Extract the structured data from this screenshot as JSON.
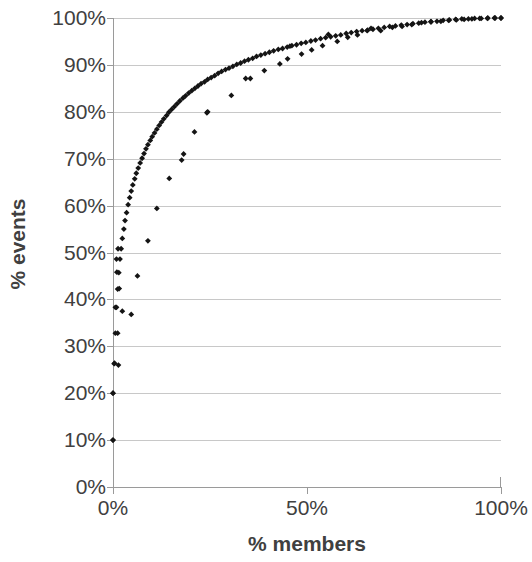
{
  "chart_data": {
    "type": "scatter",
    "title": "",
    "xlabel": "% members",
    "ylabel": "% events",
    "xlim": [
      0,
      100
    ],
    "ylim": [
      0,
      100
    ],
    "xticks": [
      "0%",
      "50%",
      "100%"
    ],
    "xtick_values": [
      0,
      50,
      100
    ],
    "yticks": [
      "0%",
      "10%",
      "20%",
      "30%",
      "40%",
      "50%",
      "60%",
      "70%",
      "80%",
      "90%",
      "100%"
    ],
    "ytick_values": [
      0,
      10,
      20,
      30,
      40,
      50,
      60,
      70,
      80,
      90,
      100
    ],
    "grid": true,
    "legend": "none",
    "marker_color": "#141414",
    "gridline_color": "#c8c8c8",
    "axis_color": "#9a9a9a",
    "label_color": "#404040",
    "series": [
      {
        "name": "dense-series",
        "marker": "diamond",
        "points": [
          [
            0.0,
            10.0
          ],
          [
            0.0,
            20.0
          ],
          [
            0.3,
            26.3
          ],
          [
            0.6,
            32.8
          ],
          [
            0.9,
            38.3
          ],
          [
            1.2,
            42.2
          ],
          [
            1.5,
            45.7
          ],
          [
            1.8,
            48.6
          ],
          [
            2.1,
            50.8
          ],
          [
            2.4,
            53.0
          ],
          [
            2.8,
            55.0
          ],
          [
            3.1,
            56.8
          ],
          [
            3.5,
            58.5
          ],
          [
            3.9,
            60.2
          ],
          [
            4.3,
            61.7
          ],
          [
            4.7,
            63.1
          ],
          [
            5.1,
            64.4
          ],
          [
            5.6,
            65.7
          ],
          [
            6.0,
            66.9
          ],
          [
            6.5,
            68.0
          ],
          [
            7.0,
            69.1
          ],
          [
            7.5,
            70.1
          ],
          [
            8.0,
            71.1
          ],
          [
            8.5,
            72.1
          ],
          [
            9.0,
            73.0
          ],
          [
            9.6,
            73.9
          ],
          [
            10.1,
            74.7
          ],
          [
            10.7,
            75.5
          ],
          [
            11.3,
            76.3
          ],
          [
            11.9,
            77.1
          ],
          [
            12.5,
            77.8
          ],
          [
            13.1,
            78.5
          ],
          [
            13.8,
            79.2
          ],
          [
            14.4,
            79.9
          ],
          [
            15.1,
            80.5
          ],
          [
            15.8,
            81.1
          ],
          [
            16.5,
            81.7
          ],
          [
            17.2,
            82.3
          ],
          [
            18.0,
            82.9
          ],
          [
            18.7,
            83.4
          ],
          [
            19.5,
            84.0
          ],
          [
            20.3,
            84.5
          ],
          [
            21.1,
            85.0
          ],
          [
            21.9,
            85.5
          ],
          [
            22.7,
            86.0
          ],
          [
            23.6,
            86.4
          ],
          [
            24.4,
            86.9
          ],
          [
            25.3,
            87.3
          ],
          [
            26.2,
            87.7
          ],
          [
            27.1,
            88.2
          ],
          [
            28.0,
            88.6
          ],
          [
            29.0,
            89.0
          ],
          [
            29.9,
            89.3
          ],
          [
            30.9,
            89.7
          ],
          [
            31.9,
            90.1
          ],
          [
            32.9,
            90.4
          ],
          [
            33.9,
            90.8
          ],
          [
            34.9,
            91.1
          ],
          [
            36.0,
            91.4
          ],
          [
            37.0,
            91.8
          ],
          [
            38.1,
            92.1
          ],
          [
            39.2,
            92.4
          ],
          [
            40.3,
            92.7
          ],
          [
            41.4,
            93.0
          ],
          [
            42.6,
            93.3
          ],
          [
            43.7,
            93.5
          ],
          [
            44.9,
            93.8
          ],
          [
            46.1,
            94.1
          ],
          [
            47.3,
            94.3
          ],
          [
            48.5,
            94.6
          ],
          [
            49.7,
            94.8
          ],
          [
            51.0,
            95.1
          ],
          [
            52.2,
            95.3
          ],
          [
            53.5,
            95.6
          ],
          [
            54.8,
            95.8
          ],
          [
            56.1,
            96.0
          ],
          [
            57.4,
            96.2
          ],
          [
            58.7,
            96.4
          ],
          [
            60.1,
            96.7
          ],
          [
            61.4,
            96.9
          ],
          [
            62.8,
            97.1
          ],
          [
            64.2,
            97.3
          ],
          [
            65.6,
            97.4
          ],
          [
            67.0,
            97.6
          ],
          [
            68.4,
            97.8
          ],
          [
            69.9,
            98.0
          ],
          [
            71.3,
            98.2
          ],
          [
            72.8,
            98.3
          ],
          [
            74.3,
            98.5
          ],
          [
            75.8,
            98.6
          ],
          [
            77.3,
            98.8
          ],
          [
            78.8,
            98.9
          ],
          [
            80.4,
            99.1
          ],
          [
            81.9,
            99.2
          ],
          [
            83.5,
            99.3
          ],
          [
            85.1,
            99.5
          ],
          [
            86.7,
            99.6
          ],
          [
            88.3,
            99.7
          ],
          [
            89.9,
            99.8
          ],
          [
            91.6,
            99.8
          ],
          [
            93.2,
            99.9
          ],
          [
            94.9,
            99.9
          ],
          [
            96.6,
            100.0
          ],
          [
            98.3,
            100.0
          ],
          [
            100.0,
            100.0
          ]
        ]
      },
      {
        "name": "sparse-series",
        "marker": "diamond",
        "points": [
          [
            0.0,
            10.0
          ],
          [
            0.0,
            20.0
          ],
          [
            0.4,
            26.4
          ],
          [
            1.4,
            26.0
          ],
          [
            1.2,
            32.8
          ],
          [
            0.6,
            38.3
          ],
          [
            2.4,
            37.5
          ],
          [
            4.7,
            36.8
          ],
          [
            1.6,
            42.3
          ],
          [
            1.0,
            45.8
          ],
          [
            0.9,
            48.6
          ],
          [
            6.3,
            45.0
          ],
          [
            1.3,
            50.8
          ],
          [
            9.0,
            52.5
          ],
          [
            11.3,
            59.4
          ],
          [
            14.5,
            65.8
          ],
          [
            17.7,
            69.7
          ],
          [
            18.2,
            71.0
          ],
          [
            21.0,
            75.7
          ],
          [
            24.2,
            79.8
          ],
          [
            24.4,
            80.0
          ],
          [
            30.5,
            83.5
          ],
          [
            34.2,
            87.1
          ],
          [
            35.4,
            87.1
          ],
          [
            39.0,
            88.8
          ],
          [
            43.0,
            90.2
          ],
          [
            45.0,
            91.3
          ],
          [
            45.6,
            94.0
          ],
          [
            48.6,
            92.3
          ],
          [
            51.2,
            93.2
          ],
          [
            54.0,
            94.1
          ],
          [
            55.5,
            96.5
          ],
          [
            57.8,
            95.0
          ],
          [
            60.5,
            95.9
          ],
          [
            63.0,
            96.4
          ],
          [
            65.5,
            97.3
          ],
          [
            66.5,
            97.8
          ],
          [
            69.0,
            97.3
          ],
          [
            72.0,
            98.0
          ],
          [
            74.5,
            98.2
          ],
          [
            77.0,
            98.6
          ],
          [
            79.5,
            99.0
          ],
          [
            82.0,
            99.2
          ],
          [
            84.5,
            99.3
          ],
          [
            86.5,
            99.5
          ],
          [
            88.5,
            99.6
          ],
          [
            90.5,
            99.7
          ],
          [
            92.5,
            99.8
          ],
          [
            94.5,
            99.9
          ],
          [
            96.5,
            99.9
          ],
          [
            98.5,
            100.0
          ],
          [
            100.0,
            100.0
          ]
        ]
      }
    ]
  }
}
